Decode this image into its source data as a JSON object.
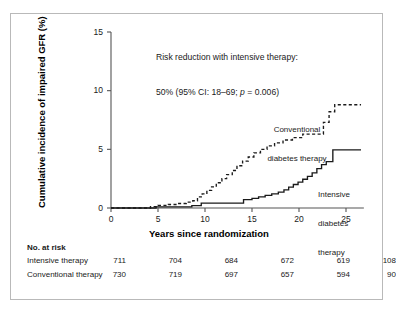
{
  "chart_data": {
    "type": "line",
    "title": "",
    "xlabel": "Years since randomization",
    "ylabel": "Cumulative incidence of impaired GFR (%)",
    "xlim": [
      0,
      27
    ],
    "ylim": [
      0,
      15
    ],
    "xticks": [
      0,
      5,
      10,
      15,
      20,
      25
    ],
    "yticks": [
      0,
      5,
      10,
      15
    ],
    "grid": false,
    "legend_position": "inline-annotations",
    "annotation": {
      "line1": "Risk reduction with intensive therapy:",
      "line2_pre": "50% (95% CI: 18–69; ",
      "line2_italic": "p",
      "line2_post": " = 0.006)"
    },
    "series": [
      {
        "name": "Conventional diabetes therapy",
        "style": "dashed",
        "label_line1": "Conventional",
        "label_line2": "diabetes therapy",
        "points": [
          [
            0,
            0
          ],
          [
            4.2,
            0
          ],
          [
            4.2,
            0.12
          ],
          [
            5.0,
            0.12
          ],
          [
            5.0,
            0.22
          ],
          [
            6.1,
            0.22
          ],
          [
            6.1,
            0.3
          ],
          [
            7.0,
            0.3
          ],
          [
            7.0,
            0.38
          ],
          [
            8.0,
            0.38
          ],
          [
            8.0,
            0.5
          ],
          [
            8.7,
            0.5
          ],
          [
            8.7,
            0.62
          ],
          [
            9.2,
            0.62
          ],
          [
            9.2,
            0.95
          ],
          [
            9.7,
            0.95
          ],
          [
            9.7,
            1.2
          ],
          [
            10.2,
            1.2
          ],
          [
            10.2,
            1.5
          ],
          [
            10.7,
            1.5
          ],
          [
            10.7,
            1.8
          ],
          [
            11.2,
            1.8
          ],
          [
            11.2,
            2.15
          ],
          [
            11.8,
            2.15
          ],
          [
            11.8,
            2.5
          ],
          [
            12.3,
            2.5
          ],
          [
            12.3,
            2.85
          ],
          [
            12.9,
            2.85
          ],
          [
            12.9,
            3.2
          ],
          [
            13.4,
            3.2
          ],
          [
            13.4,
            3.6
          ],
          [
            14.0,
            3.6
          ],
          [
            14.0,
            4.0
          ],
          [
            14.6,
            4.0
          ],
          [
            14.6,
            4.35
          ],
          [
            15.2,
            4.35
          ],
          [
            15.2,
            4.7
          ],
          [
            15.9,
            4.7
          ],
          [
            15.9,
            5.0
          ],
          [
            16.6,
            5.0
          ],
          [
            16.6,
            5.3
          ],
          [
            17.4,
            5.3
          ],
          [
            17.4,
            5.55
          ],
          [
            18.3,
            5.55
          ],
          [
            18.3,
            5.8
          ],
          [
            19.3,
            5.8
          ],
          [
            19.3,
            6.0
          ],
          [
            20.4,
            6.0
          ],
          [
            20.4,
            6.3
          ],
          [
            22.6,
            6.3
          ],
          [
            22.6,
            7.3
          ],
          [
            23.2,
            7.3
          ],
          [
            23.2,
            8.2
          ],
          [
            23.8,
            8.2
          ],
          [
            23.8,
            8.8
          ],
          [
            26.6,
            8.8
          ]
        ]
      },
      {
        "name": "Intensive diabetes therapy",
        "style": "solid",
        "label_line1": "Intensive",
        "label_line2": "diabetes",
        "label_line3": "therapy",
        "points": [
          [
            0,
            0
          ],
          [
            4.8,
            0
          ],
          [
            4.8,
            0.1
          ],
          [
            8.6,
            0.1
          ],
          [
            8.6,
            0.2
          ],
          [
            9.6,
            0.2
          ],
          [
            9.6,
            0.42
          ],
          [
            14.1,
            0.42
          ],
          [
            14.1,
            0.72
          ],
          [
            15.0,
            0.72
          ],
          [
            15.0,
            0.82
          ],
          [
            15.7,
            0.82
          ],
          [
            15.7,
            0.95
          ],
          [
            16.4,
            0.95
          ],
          [
            16.4,
            1.08
          ],
          [
            17.1,
            1.08
          ],
          [
            17.1,
            1.2
          ],
          [
            17.8,
            1.2
          ],
          [
            17.8,
            1.35
          ],
          [
            18.4,
            1.35
          ],
          [
            18.4,
            1.55
          ],
          [
            18.9,
            1.55
          ],
          [
            18.9,
            1.78
          ],
          [
            19.4,
            1.78
          ],
          [
            19.4,
            2.0
          ],
          [
            19.9,
            2.0
          ],
          [
            19.9,
            2.2
          ],
          [
            20.4,
            2.2
          ],
          [
            20.4,
            2.45
          ],
          [
            20.9,
            2.45
          ],
          [
            20.9,
            2.7
          ],
          [
            21.4,
            2.7
          ],
          [
            21.4,
            3.0
          ],
          [
            21.9,
            3.0
          ],
          [
            21.9,
            3.35
          ],
          [
            22.4,
            3.35
          ],
          [
            22.4,
            3.7
          ],
          [
            22.9,
            3.7
          ],
          [
            22.9,
            3.95
          ],
          [
            23.6,
            3.95
          ],
          [
            23.6,
            4.95
          ],
          [
            26.6,
            4.95
          ]
        ]
      }
    ]
  },
  "risk_table": {
    "heading": "No. at risk",
    "rows": [
      {
        "label": "Intensive therapy",
        "values": [
          "711",
          "704",
          "684",
          "672",
          "619",
          "108"
        ]
      },
      {
        "label": "Conventional therapy",
        "values": [
          "730",
          "719",
          "697",
          "657",
          "594",
          "90"
        ]
      }
    ]
  }
}
